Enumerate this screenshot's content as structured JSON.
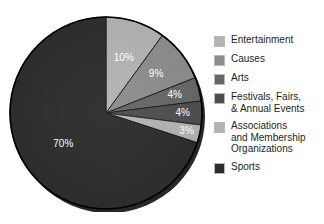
{
  "chart_data": {
    "type": "pie",
    "title": "",
    "subtitle": "",
    "xlabel": "",
    "ylabel": "",
    "legend_position": "right",
    "grid": false,
    "start_angle_deg": 0,
    "direction": "clockwise",
    "categories": [
      "Entertainment",
      "Causes",
      "Arts",
      "Festivals, Fairs,\n& Annual Events",
      "Associations\nand Membership\nOrganizations",
      "Sports"
    ],
    "values": [
      10,
      9,
      4,
      4,
      3,
      70
    ],
    "data_labels": [
      "10%",
      "9%",
      "4%",
      "4%",
      "3%",
      "70%"
    ],
    "colors": [
      "#b3b3b3",
      "#8c8c8c",
      "#666666",
      "#4d4d4d",
      "#b3b3b3",
      "#2b2b2b"
    ],
    "units": "percent",
    "total": 100
  },
  "legend": {
    "items": [
      {
        "label": "Entertainment",
        "color": "#b3b3b3",
        "value": "10%"
      },
      {
        "label": "Causes",
        "color": "#8c8c8c",
        "value": "9%"
      },
      {
        "label": "Arts",
        "color": "#666666",
        "value": "4%"
      },
      {
        "label": "Festivals, Fairs,\n& Annual Events",
        "color": "#4d4d4d",
        "value": "4%"
      },
      {
        "label": "Associations\nand Membership\nOrganizations",
        "color": "#b3b3b3",
        "value": "3%"
      },
      {
        "label": "Sports",
        "color": "#2b2b2b",
        "value": "70%"
      }
    ]
  },
  "slice_labels": {
    "s0": "10%",
    "s1": "9%",
    "s2": "4%",
    "s3": "4%",
    "s4": "3%",
    "s5": "70%"
  }
}
